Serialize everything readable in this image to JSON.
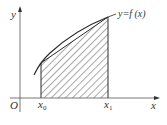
{
  "diagram": {
    "type": "area-under-curve",
    "labels": {
      "y_axis": "y",
      "x_axis": "x",
      "origin": "O",
      "x0": "x",
      "x0_sub": "0",
      "x1": "x",
      "x1_sub": "1",
      "curve": "y=f (x)"
    },
    "colors": {
      "stroke": "#2a2a2a",
      "hatch": "#555555",
      "background": "#ffffff"
    }
  }
}
